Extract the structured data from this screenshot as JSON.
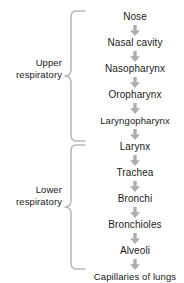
{
  "diagram": {
    "background_color": "#ffffff",
    "text_color": "#1a1a1a",
    "arrow_color": "#aeaeae",
    "brace_color": "#b9b9b9",
    "groups": [
      {
        "id": "upper",
        "label_line1": "Upper",
        "label_line2": "respiratory",
        "items": [
          {
            "label": "Nose"
          },
          {
            "label": "Nasal cavity"
          },
          {
            "label": "Nasopharynx"
          },
          {
            "label": "Oropharynx"
          },
          {
            "label": "Laryngopharynx"
          },
          {
            "label": "Larynx"
          }
        ]
      },
      {
        "id": "lower",
        "label_line1": "Lower",
        "label_line2": "respiratory",
        "items": [
          {
            "label": "Trachea"
          },
          {
            "label": "Bronchi"
          },
          {
            "label": "Bronchioles"
          },
          {
            "label": "Alveoli"
          },
          {
            "label": "Capillaries of lungs"
          }
        ]
      }
    ],
    "flow_sequence": [
      "Nose",
      "Nasal cavity",
      "Nasopharynx",
      "Oropharynx",
      "Laryngopharynx",
      "Larynx",
      "Trachea",
      "Bronchi",
      "Bronchioles",
      "Alveoli",
      "Capillaries of lungs"
    ],
    "connector_icon": "down-arrow-icon"
  }
}
